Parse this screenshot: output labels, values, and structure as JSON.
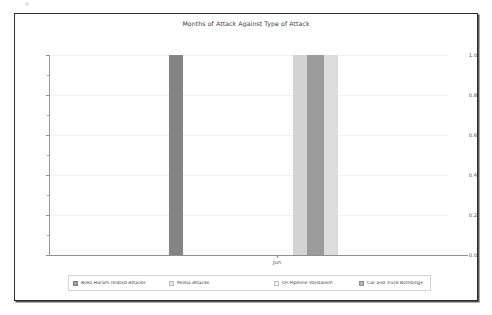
{
  "figure": {
    "title": "Months of Attack Against Type of Attack",
    "frame_color": "#2b2b2b",
    "background": "#ffffff"
  },
  "axes": {
    "x_tick_labels": [
      "Jun"
    ],
    "y_tick_labels": [
      "0.0",
      "0.2",
      "0.4",
      "0.6",
      "0.8",
      "1.0"
    ]
  },
  "legend": {
    "columns": [
      [
        {
          "label": "Boko Haram related Attacks",
          "color": "#a0a0a0"
        },
        {
          "label": "Militia Attacks",
          "color": "#ededed"
        },
        {
          "label": "Oil Pipeline Vandalism",
          "color": "#f5f5f5"
        }
      ],
      [
        {
          "label": "Car and Truck Bombings",
          "color": "#b5b5b5"
        },
        {
          "label": "Riots and Civil Unrest Attacks",
          "color": "#b0b0b0"
        },
        {
          "label": "Hostage Taking",
          "color": "#6e6e6e"
        }
      ],
      [
        {
          "label": "Kidnapping",
          "color": "#2e2e2e"
        },
        {
          "label": "Religious Attacks",
          "color": "#e0e0e0"
        },
        {
          "label": "Secession",
          "color": "#cfcfcf"
        }
      ],
      [
        {
          "label": "Suicide Bombings",
          "color": "#3a3a3a"
        },
        {
          "label": "Fulani Herdsman Attacks",
          "color": "#bdbdbd"
        },
        {
          "label": "Ethnic Violence",
          "color": "#262626"
        }
      ]
    ]
  },
  "chart_data": {
    "type": "bar",
    "title": "Months of Attack Against Type of Attack",
    "xlabel": "",
    "ylabel": "",
    "categories": [
      "Jun"
    ],
    "ylim": [
      0.0,
      1.0
    ],
    "yticks": [
      0.0,
      0.2,
      0.4,
      0.6,
      0.8,
      1.0
    ],
    "grid": true,
    "legend_position": "lower center (outside axes)",
    "series": [
      {
        "name": "Boko Haram related Attacks",
        "color": "#a0a0a0",
        "values": [
          0
        ]
      },
      {
        "name": "Militia Attacks",
        "color": "#ededed",
        "values": [
          0
        ]
      },
      {
        "name": "Oil Pipeline Vandalism",
        "color": "#f5f5f5",
        "values": [
          0
        ]
      },
      {
        "name": "Car and Truck Bombings",
        "color": "#b5b5b5",
        "values": [
          0
        ]
      },
      {
        "name": "Riots and Civil Unrest Attacks",
        "color": "#b0b0b0",
        "values": [
          0
        ]
      },
      {
        "name": "Hostage Taking",
        "color": "#6e6e6e",
        "values": [
          1
        ]
      },
      {
        "name": "Kidnapping",
        "color": "#2e2e2e",
        "values": [
          0
        ]
      },
      {
        "name": "Religious Attacks",
        "color": "#e0e0e0",
        "values": [
          0
        ]
      },
      {
        "name": "Secession",
        "color": "#cfcfcf",
        "values": [
          1
        ]
      },
      {
        "name": "Suicide Bombings",
        "color": "#3a3a3a",
        "values": [
          0
        ]
      },
      {
        "name": "Fulani Herdsman Attacks",
        "color": "#bdbdbd",
        "values": [
          1
        ]
      },
      {
        "name": "Ethnic Violence",
        "color": "#262626",
        "values": [
          0
        ]
      }
    ],
    "visible_bars": [
      {
        "series": "Hostage Taking",
        "category": "Jun",
        "value": 1.0,
        "color": "#848484",
        "x_px": 120,
        "width_px": 14
      },
      {
        "series": "Secession",
        "category": "Jun",
        "value": 1.0,
        "color": "#d3d3d3",
        "x_px": 244,
        "width_px": 14
      },
      {
        "series": "Fulani Herdsman Attacks",
        "category": "Jun",
        "value": 1.0,
        "color": "#9c9c9c",
        "x_px": 258,
        "width_px": 17
      },
      {
        "series": "Ethnic Violence",
        "category": "Jun",
        "value": 1.0,
        "color": "#dcdcdc",
        "x_px": 275,
        "width_px": 14
      }
    ]
  }
}
